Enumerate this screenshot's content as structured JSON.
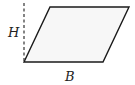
{
  "diagram": {
    "shape": "parallelogram",
    "labels": {
      "height": "H",
      "base": "B"
    },
    "colors": {
      "stroke": "#1a1a1a",
      "fill": "#f7f7f7",
      "dashed": "#333333"
    }
  }
}
